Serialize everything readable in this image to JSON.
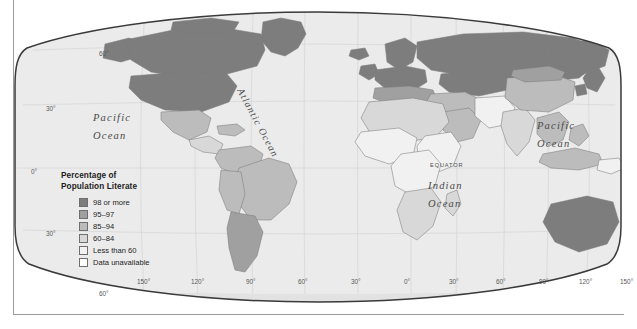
{
  "map": {
    "title": "World Literacy Map",
    "projection": "robinson",
    "background_color": "#ffffff",
    "ocean_color": "#ebebeb",
    "graticule_color": "#cfcfcf",
    "outline_color": "#3a3a3a",
    "labels": {
      "pacific_west": "Pacific\nOcean",
      "pacific_west_line1": "Pacific",
      "pacific_west_line2": "Ocean",
      "pacific_east_line1": "Pacific",
      "pacific_east_line2": "Ocean",
      "atlantic": "Atlantic Ocean",
      "indian_line1": "Indian",
      "indian_line2": "Ocean",
      "equator": "EQUATOR"
    },
    "latitude_labels": [
      {
        "text": "60°",
        "x": 86,
        "y": 42
      },
      {
        "text": "30°",
        "x": 33,
        "y": 97
      },
      {
        "text": "0°",
        "x": 18,
        "y": 160
      },
      {
        "text": "30°",
        "x": 33,
        "y": 222
      },
      {
        "text": "60°",
        "x": 86,
        "y": 282
      }
    ],
    "longitude_labels": [
      {
        "text": "150°",
        "x": 131
      },
      {
        "text": "120°",
        "x": 185
      },
      {
        "text": "90°",
        "x": 240
      },
      {
        "text": "60°",
        "x": 292
      },
      {
        "text": "30°",
        "x": 345
      },
      {
        "text": "0°",
        "x": 398
      },
      {
        "text": "30°",
        "x": 443
      },
      {
        "text": "60°",
        "x": 490
      },
      {
        "text": "90°",
        "x": 533
      },
      {
        "text": "120°",
        "x": 573
      },
      {
        "text": "150°",
        "x": 614
      }
    ]
  },
  "legend": {
    "title_line1": "Percentage of",
    "title_line2": "Population Literate",
    "items": [
      {
        "label": "98 or more",
        "color": "#7d7d7d"
      },
      {
        "label": "95–97",
        "color": "#a0a0a0"
      },
      {
        "label": "85–94",
        "color": "#bcbcbc"
      },
      {
        "label": "60–84",
        "color": "#d8d8d8"
      },
      {
        "label": "Less than 60",
        "color": "#f1f1f1"
      },
      {
        "label": "Data unavailable",
        "color": "#ffffff"
      }
    ]
  },
  "chart_data": {
    "type": "map",
    "title": "Percentage of Population Literate",
    "classes": [
      {
        "name": "98 or more",
        "color": "#7d7d7d"
      },
      {
        "name": "95-97",
        "color": "#a0a0a0"
      },
      {
        "name": "85-94",
        "color": "#bcbcbc"
      },
      {
        "name": "60-84",
        "color": "#d8d8d8"
      },
      {
        "name": "Less than 60",
        "color": "#f1f1f1"
      },
      {
        "name": "Data unavailable",
        "color": "#ffffff"
      }
    ],
    "regions": [
      {
        "name": "Canada",
        "class": "98 or more"
      },
      {
        "name": "United States",
        "class": "98 or more"
      },
      {
        "name": "Greenland",
        "class": "98 or more"
      },
      {
        "name": "Russia",
        "class": "98 or more"
      },
      {
        "name": "Northern Europe",
        "class": "98 or more"
      },
      {
        "name": "Australia",
        "class": "98 or more"
      },
      {
        "name": "Japan",
        "class": "98 or more"
      },
      {
        "name": "Kazakhstan",
        "class": "98 or more"
      },
      {
        "name": "Mexico",
        "class": "85-94"
      },
      {
        "name": "Brazil",
        "class": "85-94"
      },
      {
        "name": "Argentina",
        "class": "95-97"
      },
      {
        "name": "Chile",
        "class": "95-97"
      },
      {
        "name": "Southern Europe",
        "class": "95-97"
      },
      {
        "name": "China",
        "class": "85-94"
      },
      {
        "name": "India",
        "class": "60-84"
      },
      {
        "name": "Indonesia",
        "class": "85-94"
      },
      {
        "name": "North Africa",
        "class": "60-84"
      },
      {
        "name": "Sub-Saharan Africa",
        "class": "Less than 60"
      },
      {
        "name": "Afghanistan",
        "class": "Less than 60"
      },
      {
        "name": "Pakistan",
        "class": "Less than 60"
      }
    ],
    "legend_position": "lower-left",
    "grid": true
  }
}
